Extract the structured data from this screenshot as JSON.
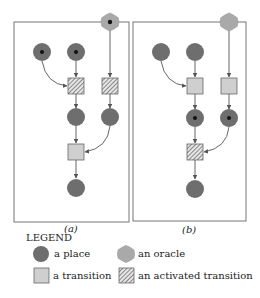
{
  "colors": {
    "place": "#6e6e6e",
    "token": "#111111",
    "transition": "#cfcfcf",
    "oracle": "#a9a9a9",
    "edge": "#555555",
    "border": "#777777"
  },
  "panels": [
    {
      "caption": "(a)",
      "oracle_token": true,
      "places": [
        {
          "id": "p1",
          "token": true
        },
        {
          "id": "p2",
          "token": true
        },
        {
          "id": "p3",
          "token": false
        },
        {
          "id": "p4",
          "token": false
        },
        {
          "id": "p5",
          "token": false
        }
      ],
      "transitions": [
        {
          "id": "t1",
          "activated": true
        },
        {
          "id": "t2",
          "activated": true
        },
        {
          "id": "t3",
          "activated": false
        }
      ]
    },
    {
      "caption": "(b)",
      "oracle_token": false,
      "places": [
        {
          "id": "p1",
          "token": false
        },
        {
          "id": "p2",
          "token": false
        },
        {
          "id": "p3",
          "token": true
        },
        {
          "id": "p4",
          "token": true
        },
        {
          "id": "p5",
          "token": false
        }
      ],
      "transitions": [
        {
          "id": "t1",
          "activated": false
        },
        {
          "id": "t2",
          "activated": false
        },
        {
          "id": "t3",
          "activated": true
        }
      ]
    }
  ],
  "legend": {
    "title": "LEGEND",
    "items": [
      {
        "symbol": "place",
        "label": "a place"
      },
      {
        "symbol": "oracle",
        "label": "an oracle"
      },
      {
        "symbol": "transition",
        "label": "a transition"
      },
      {
        "symbol": "activated-transition",
        "label": "an activated transition"
      }
    ]
  }
}
